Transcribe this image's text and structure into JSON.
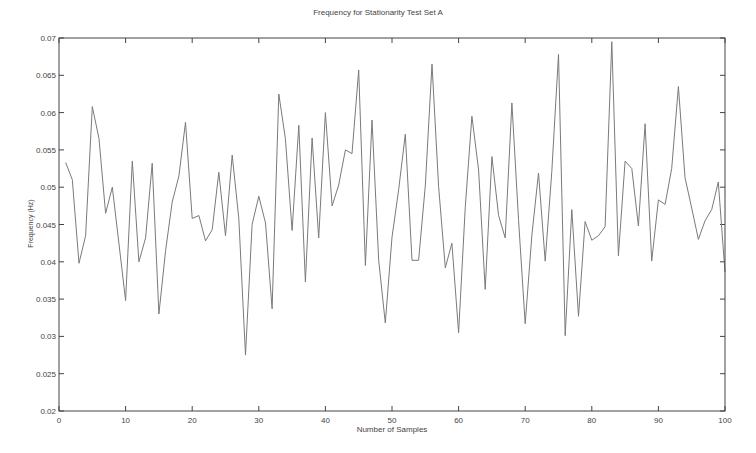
{
  "chart_data": {
    "type": "line",
    "title": "Frequency for Stationarity Test Set A",
    "xlabel": "Number of Samples",
    "ylabel": "Frequency (Hz)",
    "xlim": [
      0,
      100
    ],
    "ylim": [
      0.02,
      0.07
    ],
    "grid": false,
    "legend": null,
    "x_ticks": [
      "0",
      "10",
      "20",
      "30",
      "40",
      "50",
      "60",
      "70",
      "80",
      "90",
      "100"
    ],
    "y_ticks": [
      "0.02",
      "0.025",
      "0.03",
      "0.035",
      "0.04",
      "0.045",
      "0.05",
      "0.055",
      "0.06",
      "0.065",
      "0.07"
    ],
    "series": [
      {
        "name": "Frequency",
        "color": "#7a7a7a",
        "x": [
          1,
          2,
          3,
          4,
          5,
          6,
          7,
          8,
          9,
          10,
          11,
          12,
          13,
          14,
          15,
          16,
          17,
          18,
          19,
          20,
          21,
          22,
          23,
          24,
          25,
          26,
          27,
          28,
          29,
          30,
          31,
          32,
          33,
          34,
          35,
          36,
          37,
          38,
          39,
          40,
          41,
          42,
          43,
          44,
          45,
          46,
          47,
          48,
          49,
          50,
          51,
          52,
          53,
          54,
          55,
          56,
          57,
          58,
          59,
          60,
          61,
          62,
          63,
          64,
          65,
          66,
          67,
          68,
          69,
          70,
          71,
          72,
          73,
          74,
          75,
          76,
          77,
          78,
          79,
          80,
          81,
          82,
          83,
          84,
          85,
          86,
          87,
          88,
          89,
          90,
          91,
          92,
          93,
          94,
          95,
          96,
          97,
          98,
          99,
          100
        ],
        "values": [
          0.0533,
          0.051,
          0.0398,
          0.0435,
          0.0608,
          0.0565,
          0.0465,
          0.05,
          0.0425,
          0.0348,
          0.0535,
          0.04,
          0.0432,
          0.0532,
          0.033,
          0.0415,
          0.048,
          0.0515,
          0.0587,
          0.0458,
          0.0462,
          0.0428,
          0.0443,
          0.052,
          0.0435,
          0.0543,
          0.0458,
          0.0275,
          0.045,
          0.0488,
          0.0452,
          0.0337,
          0.0625,
          0.0565,
          0.0442,
          0.0583,
          0.0373,
          0.0566,
          0.0432,
          0.06,
          0.0475,
          0.0503,
          0.055,
          0.0545,
          0.0657,
          0.0395,
          0.059,
          0.0402,
          0.0318,
          0.0433,
          0.0497,
          0.0571,
          0.0402,
          0.0402,
          0.0502,
          0.0665,
          0.0501,
          0.0392,
          0.0425,
          0.0305,
          0.0474,
          0.0595,
          0.0523,
          0.0363,
          0.0541,
          0.0462,
          0.0432,
          0.0613,
          0.0457,
          0.0317,
          0.0436,
          0.0519,
          0.0401,
          0.0521,
          0.0678,
          0.0301,
          0.047,
          0.0327,
          0.0454,
          0.0429,
          0.0435,
          0.0447,
          0.0695,
          0.0408,
          0.0535,
          0.0525,
          0.0448,
          0.0585,
          0.0401,
          0.0483,
          0.0477,
          0.0525,
          0.0635,
          0.0513,
          0.0472,
          0.043,
          0.0455,
          0.047,
          0.0507,
          0.0386
        ]
      }
    ]
  }
}
